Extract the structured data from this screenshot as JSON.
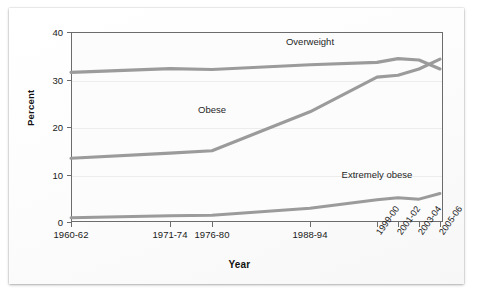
{
  "chart_data": {
    "type": "line",
    "title": "",
    "xlabel": "Year",
    "ylabel": "Percent",
    "ylim": [
      0,
      40
    ],
    "yticks": [
      0,
      10,
      20,
      30,
      40
    ],
    "grid": true,
    "legend_position": "inline-annotation",
    "x": [
      "1960-62",
      "1971-74",
      "1976-80",
      "1988-94",
      "1999-00",
      "2001-02",
      "2003-04",
      "2005-06"
    ],
    "categories": [
      "1960-62",
      "1971-74",
      "1976-80",
      "1988-94",
      "1999-00",
      "2001-02",
      "2003-04",
      "2005-06"
    ],
    "series": [
      {
        "name": "Overweight",
        "color": "#9b9b9b",
        "values": [
          31.5,
          32.3,
          32.1,
          33.1,
          33.6,
          34.4,
          34.1,
          32.2
        ],
        "label_x": "1988-94",
        "label_y": 38.0
      },
      {
        "name": "Obese",
        "color": "#9b9b9b",
        "values": [
          13.4,
          14.5,
          15.0,
          23.2,
          30.5,
          30.9,
          32.2,
          34.3
        ],
        "label_x": "1976-80",
        "label_y": 23.5
      },
      {
        "name": "Extremely obese",
        "color": "#9b9b9b",
        "values": [
          0.9,
          1.3,
          1.4,
          2.9,
          4.7,
          5.1,
          4.8,
          6.0
        ],
        "label_x": "1999-00",
        "label_y": 10.0
      }
    ],
    "xtick_labels_rotated": [
      "1999-00",
      "2001-02",
      "2003-04",
      "2005-06"
    ],
    "xtick_labels_horizontal": [
      "1960-62",
      "1971-74",
      "1976-80",
      "1988-94"
    ]
  },
  "axis": {
    "y_title": "Percent",
    "x_title": "Year",
    "y_ticks": [
      "0",
      "10",
      "20",
      "30",
      "40"
    ],
    "x_ticks": [
      "1960-62",
      "1971-74",
      "1976-80",
      "1988-94",
      "1999-00",
      "2001-02",
      "2003-04",
      "2005-06"
    ]
  },
  "annotations": {
    "overweight": "Overweight",
    "obese": "Obese",
    "extremely_obese": "Extremely obese"
  },
  "colors": {
    "line": "#9b9b9b",
    "frame": "#6c6c6c",
    "grid": "#ececec",
    "text": "#1a1a1a",
    "card": "#fbfbfb"
  }
}
